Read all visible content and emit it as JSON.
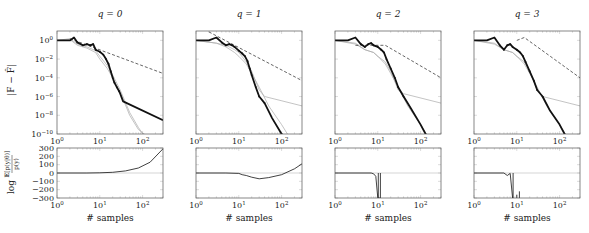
{
  "chart_data": {
    "type": "line",
    "layout": "2 rows x 4 columns, shared x-axis per column",
    "columns": [
      {
        "title": "q = 0",
        "top": {
          "ylabel": "|F − F̂|",
          "yscale": "log",
          "ylim": [
            1e-10,
            10
          ],
          "series": [
            {
              "name": "estimate (bold)",
              "style": "black-thick",
              "x": [
                1,
                2,
                2.5,
                3,
                4,
                5,
                6,
                7,
                8,
                10,
                12,
                14,
                16,
                18,
                20,
                22,
                25,
                28,
                30,
                35,
                300
              ],
              "y": [
                1,
                1,
                2,
                0.6,
                0.3,
                0.4,
                0.3,
                0.4,
                0.1,
                0.06,
                0.03,
                0.01,
                0.003,
                0.0005,
                0.0001,
                3e-05,
                1e-05,
                4e-06,
                2e-06,
                3e-07,
                3e-09
              ]
            },
            {
              "name": "reference a",
              "style": "gray-thin",
              "x": [
                1,
                2,
                3,
                5,
                8,
                10,
                15,
                20,
                30,
                50,
                80,
                120,
                300
              ],
              "y": [
                1,
                1.5,
                0.4,
                0.2,
                0.08,
                0.02,
                0.002,
                0.0002,
                5e-06,
                2e-08,
                5e-10,
                1e-11,
                1e-13
              ]
            },
            {
              "name": "reference b",
              "style": "gray-thin",
              "x": [
                1,
                2,
                3,
                5,
                8,
                10,
                15,
                20,
                30,
                50,
                80,
                150
              ],
              "y": [
                1,
                1.2,
                0.3,
                0.15,
                0.05,
                0.01,
                0.001,
                0.0001,
                3e-06,
                1e-08,
                3e-10,
                1e-12
              ]
            },
            {
              "name": "slope reference",
              "style": "black-dashed",
              "x": [
                2,
                300
              ],
              "y": [
                1.5,
                0.0003
              ]
            }
          ]
        },
        "bottom": {
          "ylabel": "log E[p(y|θ)] / p(y)",
          "ylim": [
            -300,
            300
          ],
          "series": [
            {
              "name": "log ratio",
              "style": "black-thin",
              "x": [
                1,
                5,
                10,
                20,
                40,
                80,
                150,
                300
              ],
              "y": [
                0,
                0,
                2,
                8,
                25,
                60,
                130,
                290
              ]
            }
          ]
        }
      },
      {
        "title": "q = 1",
        "top": {
          "yscale": "log",
          "ylim": [
            1e-10,
            10
          ],
          "series": [
            {
              "name": "estimate (bold)",
              "style": "black-thick",
              "x": [
                1,
                2,
                3,
                4,
                5,
                6,
                7,
                8,
                10,
                12,
                14,
                16,
                18,
                20,
                25,
                30,
                40,
                60,
                100,
                150
              ],
              "y": [
                1,
                1,
                2,
                0.6,
                0.3,
                0.4,
                0.3,
                0.2,
                0.08,
                0.04,
                0.02,
                0.006,
                0.001,
                0.0002,
                1e-05,
                1e-06,
                2e-07,
                5e-09,
                1e-10,
                1e-11
              ]
            },
            {
              "name": "reference a",
              "style": "gray-thin",
              "x": [
                1,
                3,
                5,
                8,
                10,
                15,
                20,
                30,
                40,
                300
              ],
              "y": [
                1,
                0.5,
                0.3,
                0.1,
                0.05,
                0.005,
                0.0005,
                5e-06,
                1e-06,
                1e-07
              ]
            },
            {
              "name": "reference b",
              "style": "gray-thin",
              "x": [
                1,
                3,
                5,
                8,
                10,
                15,
                20,
                30,
                50,
                100,
                160
              ],
              "y": [
                1,
                0.5,
                0.2,
                0.05,
                0.02,
                0.003,
                0.0003,
                1e-05,
                1e-07,
                1e-09,
                1e-11
              ]
            },
            {
              "name": "slope reference",
              "style": "black-dashed",
              "x": [
                2,
                300
              ],
              "y": [
                8,
                5e-05
              ]
            }
          ]
        },
        "bottom": {
          "ylim": [
            -300,
            300
          ],
          "series": [
            {
              "name": "log ratio",
              "style": "black-thin",
              "x": [
                1,
                5,
                10,
                12,
                15,
                20,
                30,
                50,
                100,
                200,
                300
              ],
              "y": [
                0,
                0,
                -5,
                -20,
                -30,
                -50,
                -70,
                -55,
                -20,
                50,
                110
              ]
            }
          ]
        }
      },
      {
        "title": "q = 2",
        "top": {
          "yscale": "log",
          "ylim": [
            1e-10,
            10
          ],
          "series": [
            {
              "name": "estimate (bold)",
              "style": "black-thick",
              "x": [
                1,
                2,
                3,
                4,
                5,
                6,
                7,
                8,
                10,
                12,
                14,
                16,
                20,
                25,
                30,
                40,
                60,
                100,
                150
              ],
              "y": [
                1,
                1,
                2,
                0.4,
                0.2,
                0.4,
                0.5,
                0.3,
                0.2,
                0.1,
                0.05,
                0.01,
                0.001,
                0.0001,
                1e-05,
                1e-06,
                5e-08,
                1e-09,
                1e-11
              ]
            },
            {
              "name": "reference a",
              "style": "gray-thin",
              "x": [
                1,
                3,
                5,
                8,
                10,
                15,
                20,
                30,
                40,
                300
              ],
              "y": [
                1,
                0.5,
                0.1,
                0.05,
                0.02,
                0.005,
                0.0005,
                5e-06,
                2e-06,
                2e-07
              ]
            },
            {
              "name": "reference b",
              "style": "gray-thin",
              "x": [
                1,
                3,
                5,
                8,
                10,
                15,
                20,
                30,
                50,
                100,
                160
              ],
              "y": [
                1,
                0.4,
                0.1,
                0.05,
                0.02,
                0.003,
                0.0003,
                1e-05,
                1e-07,
                1e-09,
                1e-11
              ]
            },
            {
              "name": "slope reference",
              "style": "black-dashed",
              "x": [
                3,
                15,
                300
              ],
              "y": [
                0.3,
                0.3,
                0.0001
              ]
            }
          ]
        },
        "bottom": {
          "ylim": [
            -300,
            300
          ],
          "series": [
            {
              "name": "log ratio",
              "style": "black-thin",
              "x": [
                1,
                7,
                8,
                9,
                10,
                10.5,
                11,
                11.5
              ],
              "y": [
                0,
                0,
                -10,
                -40,
                -300,
                -300,
                -300,
                -300
              ]
            }
          ]
        }
      },
      {
        "title": "q = 3",
        "top": {
          "yscale": "log",
          "ylim": [
            1e-10,
            10
          ],
          "series": [
            {
              "name": "estimate (bold)",
              "style": "black-thick",
              "x": [
                1,
                2,
                3,
                4,
                5,
                6,
                7,
                8,
                10,
                12,
                14,
                16,
                20,
                25,
                30,
                40,
                60,
                100,
                150
              ],
              "y": [
                1,
                1,
                2,
                0.3,
                0.1,
                0.3,
                0.4,
                0.2,
                0.1,
                0.05,
                0.02,
                0.005,
                0.0005,
                5e-05,
                5e-06,
                1e-06,
                3e-08,
                1e-09,
                1e-11
              ]
            },
            {
              "name": "reference a",
              "style": "gray-thin",
              "x": [
                1,
                3,
                5,
                8,
                10,
                15,
                20,
                30,
                40,
                300
              ],
              "y": [
                1,
                0.5,
                0.1,
                0.05,
                0.02,
                0.005,
                0.0005,
                5e-06,
                1e-06,
                1e-07
              ]
            },
            {
              "name": "reference b",
              "style": "gray-thin",
              "x": [
                1,
                3,
                5,
                8,
                10,
                15,
                20,
                30,
                50,
                100,
                160
              ],
              "y": [
                1,
                0.4,
                0.1,
                0.05,
                0.02,
                0.003,
                0.0003,
                1e-05,
                1e-07,
                1e-09,
                1e-11
              ]
            },
            {
              "name": "slope reference",
              "style": "black-dashed",
              "x": [
                10,
                15,
                300
              ],
              "y": [
                1,
                2,
                0.0001
              ]
            }
          ]
        },
        "bottom": {
          "ylim": [
            -300,
            300
          ],
          "series": [
            {
              "name": "log ratio",
              "style": "black-thin",
              "x": [
                1,
                5,
                6,
                7,
                8,
                8.2
              ],
              "y": [
                0,
                0,
                -30,
                -5,
                -300,
                -300
              ]
            }
          ]
        }
      }
    ],
    "xlabel": "# samples",
    "xscale": "log",
    "xlim": [
      1,
      300
    ],
    "xticks": [
      "10^0",
      "10^1",
      "10^2"
    ],
    "top_yticks": [
      "10^0",
      "10^-2",
      "10^-4",
      "10^-6",
      "10^-8",
      "10^-10"
    ],
    "bottom_yticks": [
      "300",
      "200",
      "100",
      "0",
      "−100",
      "−200",
      "−300"
    ],
    "grid": false,
    "legend": "none"
  },
  "labels": {
    "top_ylabel_main": "|F − F̂|",
    "bottom_ylabel_log": "log",
    "bottom_ylabel_num": "𝔼[p(y|θ)]",
    "bottom_ylabel_den": "p(y)",
    "xlabel": "# samples"
  },
  "colors": {
    "axis": "#555555",
    "bold_line": "#111111",
    "thin_gray": "#aaaaaa",
    "dashed": "#222222",
    "zero_line": "#bbbbbb"
  }
}
